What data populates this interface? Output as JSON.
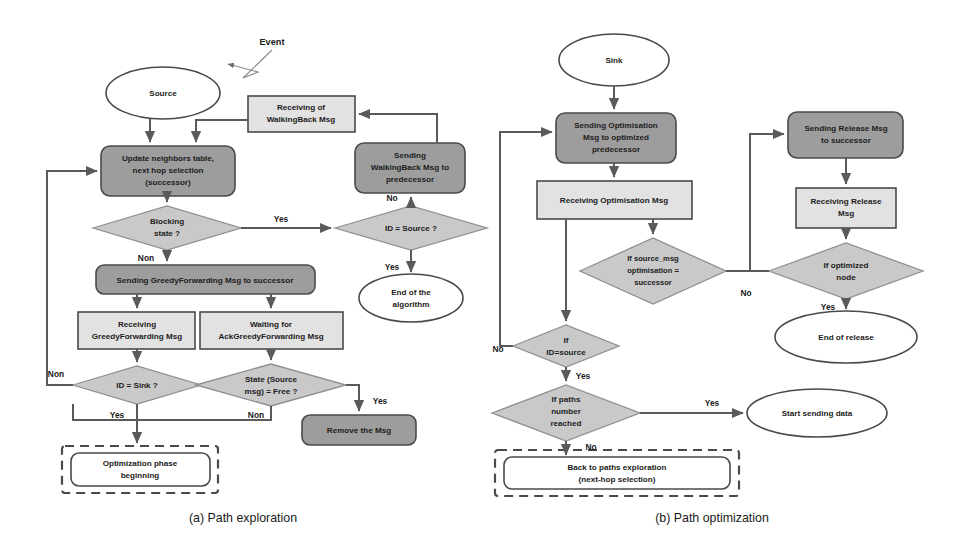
{
  "figure": {
    "captions": [
      {
        "id": "caption-a",
        "text": "(a) Path exploration",
        "x": 243,
        "y": 522
      },
      {
        "id": "caption-b",
        "text": "(b) Path optimization",
        "x": 712,
        "y": 522
      }
    ]
  },
  "panel_a": {
    "name": "Path exploration",
    "nodes": {
      "event": {
        "label": "Event",
        "shape": "annotation"
      },
      "source": {
        "label": "Source",
        "shape": "ellipse"
      },
      "receiving_wb": {
        "label_line1": "Receiving of",
        "label_line2": "WalkingBack Msg",
        "shape": "rect-light"
      },
      "sending_wb": {
        "label_line1": "Sending",
        "label_line2": "WalkingBack Msg  to",
        "label_line3": "predecessor",
        "shape": "roundrect-dark"
      },
      "update_neighbors": {
        "label_line1": "Update neighbors table,",
        "label_line2": "next hop selection",
        "label_line3": "(successor)",
        "shape": "roundrect-dark"
      },
      "blocking_state": {
        "label_line1": "Blocking",
        "label_line2": "state ?",
        "shape": "diamond"
      },
      "id_source": {
        "label": "ID = Source ?",
        "shape": "diamond"
      },
      "end_algorithm": {
        "label_line1": "End of the",
        "label_line2": "algorithm",
        "shape": "ellipse"
      },
      "sending_gf": {
        "label": "Sending GreedyForwarding Msg to  successor",
        "shape": "roundrect-dark"
      },
      "receiving_gf": {
        "label_line1": "Receiving",
        "label_line2": "GreedyForwarding Msg",
        "shape": "rect-light"
      },
      "waiting_ack": {
        "label_line1": "Waiting for",
        "label_line2": "AckGreedyForwarding Msg",
        "shape": "rect-light"
      },
      "id_sink": {
        "label": "ID = Sink ?",
        "shape": "diamond"
      },
      "state_free": {
        "label_line1": "State (Source",
        "label_line2": "msg) = Free ?",
        "shape": "diamond"
      },
      "remove_msg": {
        "label": "Remove the Msg",
        "shape": "roundrect-dark"
      },
      "optimization_phase": {
        "label_line1": "Optimization phase",
        "label_line2": "beginning",
        "shape": "roundrect-white-dashedgroup"
      }
    },
    "edge_labels": {
      "blocking_yes": "Yes",
      "blocking_non": "Non",
      "idsource_no": "No",
      "idsource_yes": "Yes",
      "idsink_non": "Non",
      "idsink_yes": "Yes",
      "state_yes": "Yes",
      "state_non": "Non"
    }
  },
  "panel_b": {
    "name": "Path optimization",
    "nodes": {
      "sink": {
        "label": "Sink",
        "shape": "ellipse"
      },
      "sending_opt": {
        "label_line1": "Sending Optimisation",
        "label_line2": "Msg to optimized",
        "label_line3": "predecessor",
        "shape": "roundrect-dark"
      },
      "receiving_opt": {
        "label": "Receiving Optimisation Msg",
        "shape": "rect-light"
      },
      "if_source_msg": {
        "label_line1": "If source_msg",
        "label_line2": "optimisation =",
        "label_line3": "successor",
        "shape": "diamond"
      },
      "if_id_source": {
        "label_line1": "If",
        "label_line2": "ID=source",
        "shape": "diamond"
      },
      "if_paths": {
        "label_line1": "If paths",
        "label_line2": "number",
        "label_line3": "reached",
        "shape": "diamond"
      },
      "start_sending": {
        "label": "Start sending data",
        "shape": "ellipse"
      },
      "back_to_paths": {
        "label_line1": "Back to paths exploration",
        "label_line2": "(next-hop selection)",
        "shape": "roundrect-white-dashedgroup"
      },
      "sending_release": {
        "label_line1": "Sending Release Msg",
        "label_line2": "to successor",
        "shape": "roundrect-dark"
      },
      "receiving_release": {
        "label_line1": "Receiving Release",
        "label_line2": "Msg",
        "shape": "rect-light"
      },
      "if_optimized": {
        "label_line1": "If optimized",
        "label_line2": "node",
        "shape": "diamond"
      },
      "end_release": {
        "label": "End of release",
        "shape": "ellipse"
      }
    },
    "edge_labels": {
      "idsource_no": "No",
      "idsource_yes": "Yes",
      "paths_yes": "Yes",
      "paths_no": "No",
      "optimized_no": "No",
      "optimized_yes": "Yes"
    }
  },
  "colors": {
    "dark_node": "#9d9d9d",
    "light_node": "#e2e2e2",
    "diamond": "#c9c9c9",
    "white_node": "#ffffff",
    "stroke": "#4a4a4a",
    "connector": "#5a5a5a",
    "text": "#1c1c1c",
    "background": "#ffffff"
  }
}
